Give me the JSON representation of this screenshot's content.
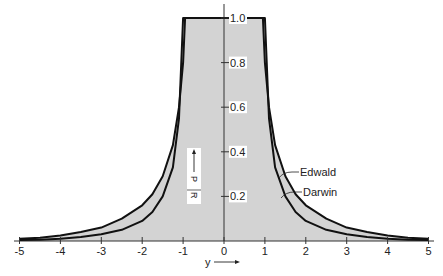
{
  "chart_data": {
    "type": "line",
    "title": "",
    "xlabel": "y",
    "ylabel": "P_R / R_0",
    "xlim": [
      -5,
      5
    ],
    "ylim": [
      0,
      1.0
    ],
    "x_ticks": [
      "-5",
      "-4",
      "-3",
      "-2",
      "-1",
      "0",
      "1",
      "2",
      "3",
      "4",
      "5"
    ],
    "y_ticks": [
      "0.2",
      "0.4",
      "0.6",
      "0.8",
      "1.0"
    ],
    "grid": false,
    "legend": "inline annotations",
    "series": [
      {
        "name": "Edwald",
        "x": [
          -5,
          -4.5,
          -4,
          -3.5,
          -3,
          -2.5,
          -2,
          -1.75,
          -1.5,
          -1.25,
          -1.1,
          -1,
          -0.95,
          0,
          0.95,
          1,
          1.1,
          1.25,
          1.5,
          1.75,
          2,
          2.5,
          3,
          3.5,
          4,
          4.5,
          5
        ],
        "values": [
          0.01,
          0.015,
          0.025,
          0.04,
          0.06,
          0.1,
          0.16,
          0.21,
          0.29,
          0.43,
          0.6,
          0.8,
          1.0,
          1.0,
          1.0,
          0.8,
          0.6,
          0.43,
          0.29,
          0.21,
          0.16,
          0.1,
          0.06,
          0.04,
          0.025,
          0.015,
          0.01
        ]
      },
      {
        "name": "Darwin",
        "x": [
          -5,
          -4.5,
          -4,
          -3.5,
          -3,
          -2.5,
          -2,
          -1.75,
          -1.5,
          -1.25,
          -1.1,
          -1,
          0,
          1,
          1.1,
          1.25,
          1.5,
          1.75,
          2,
          2.5,
          3,
          3.5,
          4,
          4.5,
          5
        ],
        "values": [
          0.004,
          0.006,
          0.01,
          0.018,
          0.03,
          0.05,
          0.09,
          0.13,
          0.2,
          0.33,
          0.55,
          1.0,
          1.0,
          1.0,
          0.55,
          0.33,
          0.2,
          0.13,
          0.09,
          0.05,
          0.03,
          0.018,
          0.01,
          0.006,
          0.004
        ]
      }
    ],
    "annotations": [
      "Edwald",
      "Darwin"
    ]
  },
  "axis": {
    "x_label": "y",
    "y_label_num": "P",
    "y_label_sub": "R",
    "y_label_den": "R",
    "y_label_den_sub": "0"
  },
  "colors": {
    "fill": "#d3d3d3",
    "curve": "#111111",
    "axis": "#333333"
  }
}
